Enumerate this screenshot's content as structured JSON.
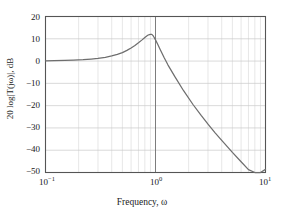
{
  "chart_data": {
    "type": "line",
    "title": "",
    "xlabel": "Frequency, ω",
    "ylabel": "20 log|T(jω)|, dB",
    "xscale": "log",
    "xlim": [
      0.1,
      10
    ],
    "ylim": [
      -50,
      20
    ],
    "yticks": [
      20,
      10,
      0,
      -10,
      -20,
      -30,
      -40,
      -50
    ],
    "ytick_labels": [
      "20",
      "10",
      "0",
      "−10",
      "−20",
      "−30",
      "−40",
      "−50"
    ],
    "xticks": [
      0.1,
      1,
      10
    ],
    "xtick_labels": [
      "10⁻¹",
      "10⁰",
      "10¹"
    ],
    "xtick_mantissa": [
      "10",
      "10",
      "10"
    ],
    "xtick_exponent": [
      "−1",
      "0",
      "1"
    ],
    "grid": true,
    "grid_minor": true,
    "legend": null,
    "series": [
      {
        "name": "20 log|T(jω)|",
        "color": "#6e6e6e",
        "x": [
          0.1,
          0.12,
          0.15,
          0.18,
          0.22,
          0.26,
          0.3,
          0.35,
          0.4,
          0.45,
          0.5,
          0.55,
          0.6,
          0.65,
          0.7,
          0.75,
          0.8,
          0.85,
          0.88,
          0.9,
          0.92,
          0.93,
          0.95,
          0.97,
          1.0,
          1.05,
          1.1,
          1.2,
          1.3,
          1.5,
          1.8,
          2.2,
          2.6,
          3.0,
          3.5,
          4.0,
          5.0,
          6.0,
          7.0,
          8.0,
          9.0,
          10.0
        ],
        "y": [
          0.1,
          0.2,
          0.3,
          0.4,
          0.6,
          0.9,
          1.2,
          1.7,
          2.3,
          3.0,
          3.8,
          4.8,
          5.9,
          7.0,
          8.2,
          9.4,
          10.6,
          11.6,
          11.9,
          12.0,
          12.0,
          11.9,
          11.4,
          10.7,
          9.5,
          7.4,
          5.3,
          1.5,
          -1.8,
          -7.0,
          -13.3,
          -19.6,
          -24.4,
          -28.3,
          -32.3,
          -35.6,
          -41.0,
          -45.2,
          -48.7,
          -51.7,
          -54.3,
          -48.6
        ]
      }
    ],
    "annotations": {
      "peak_db": 12,
      "peak_omega": 0.93,
      "value_at_omega_1": 9.5,
      "value_at_omega_10": -48.6,
      "lowfreq_asymptote_db": 0
    },
    "colors": {
      "curve": "#6e6e6e",
      "frame": "#555555",
      "grid_minor": "#dcdcdc",
      "grid_major": "#c8c8c8",
      "grid_decade": "#6e6e6e",
      "text": "#1a1a1a",
      "background": "#ffffff"
    }
  }
}
